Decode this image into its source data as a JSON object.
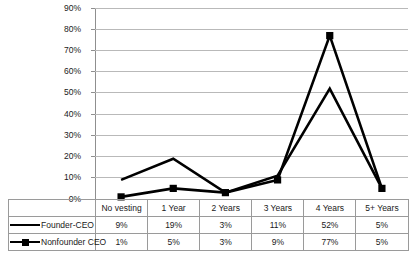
{
  "chart_data": {
    "type": "line",
    "title": "",
    "subtitle": "",
    "xlabel": "",
    "ylabel": "",
    "categories": [
      "No vesting",
      "1 Year",
      "2 Years",
      "3 Years",
      "4 Years",
      "5+ Years"
    ],
    "series": [
      {
        "name": "Founder-CEO",
        "values": [
          9,
          19,
          3,
          11,
          52,
          5
        ],
        "labels": [
          "9%",
          "19%",
          "3%",
          "11%",
          "52%",
          "5%"
        ],
        "marker": "none",
        "color": "#000000"
      },
      {
        "name": "Nonfounder CEO",
        "values": [
          1,
          5,
          3,
          9,
          77,
          5
        ],
        "labels": [
          "1%",
          "5%",
          "3%",
          "9%",
          "77%",
          "5%"
        ],
        "marker": "square",
        "color": "#000000"
      }
    ],
    "ylim": [
      0,
      90
    ],
    "ytick_step": 10,
    "ytick_labels": [
      "0%",
      "10%",
      "20%",
      "30%",
      "40%",
      "50%",
      "60%",
      "70%",
      "80%",
      "90%"
    ],
    "grid": true,
    "grid_axis": "y",
    "legend_position": "bottom-table",
    "value_suffix": "%",
    "colors": {
      "gridline": "#b9b9b9",
      "axis": "#8f8f8f",
      "series": "#000000",
      "table_border": "#9a9a9a",
      "background": "#ffffff",
      "text": "#1a1a1a"
    }
  }
}
